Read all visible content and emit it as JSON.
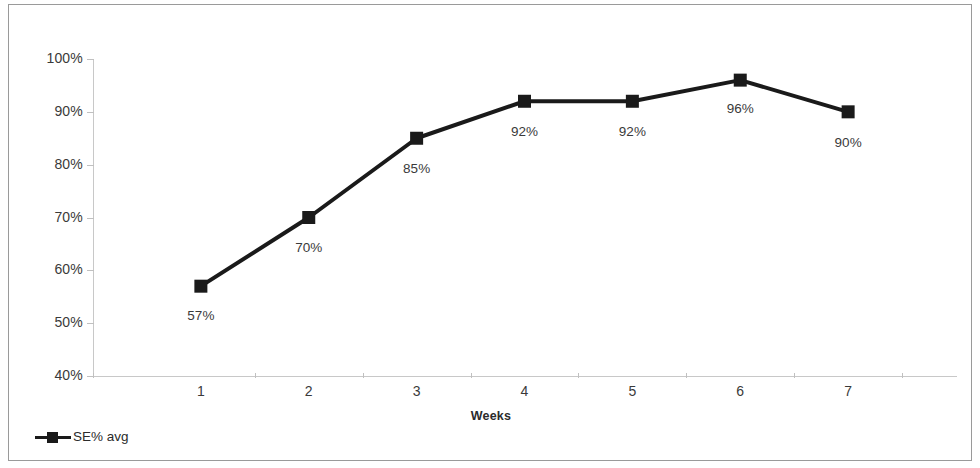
{
  "chart_data": {
    "type": "line",
    "title": "",
    "xlabel": "Weeks",
    "ylabel": "Sleep Efficiency %",
    "categories": [
      "1",
      "2",
      "3",
      "4",
      "5",
      "6",
      "7"
    ],
    "x": [
      1,
      2,
      3,
      4,
      5,
      6,
      7
    ],
    "values": [
      57,
      70,
      85,
      92,
      92,
      96,
      90
    ],
    "data_labels": [
      "57%",
      "70%",
      "85%",
      "92%",
      "92%",
      "96%",
      "90%"
    ],
    "series": [
      {
        "name": "SE% avg",
        "values": [
          57,
          70,
          85,
          92,
          92,
          96,
          90
        ],
        "color": "#1a1a1a",
        "marker": "square"
      }
    ],
    "ylim": [
      40,
      100
    ],
    "ytick_values": [
      40,
      50,
      60,
      70,
      80,
      90,
      100
    ],
    "ytick_labels": [
      "40%",
      "50%",
      "60%",
      "70%",
      "80%",
      "90%",
      "100%"
    ],
    "xtick_labels": [
      "1",
      "2",
      "3",
      "4",
      "5",
      "6",
      "7"
    ],
    "grid": false,
    "legend": {
      "position": "bottom-left",
      "entries": [
        "SE% avg"
      ]
    },
    "axis_color": "#c8c8c8",
    "text_color": "#3a3a3a",
    "background": "#ffffff",
    "border_color": "#9a9a9a"
  },
  "legend": {
    "label": "SE% avg"
  },
  "axes": {
    "y_title": "Sleep Efficiency %",
    "x_title": "Weeks"
  }
}
